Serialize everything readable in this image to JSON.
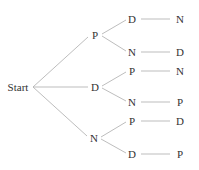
{
  "diagram": {
    "type": "tree",
    "title": "",
    "root": {
      "id": "start",
      "label": "Start",
      "x": 18,
      "y": 87
    },
    "nodes": [
      {
        "id": "l1_p",
        "label": "P",
        "x": 95,
        "y": 35
      },
      {
        "id": "l1_d",
        "label": "D",
        "x": 95,
        "y": 87
      },
      {
        "id": "l1_n",
        "label": "N",
        "x": 94,
        "y": 138
      },
      {
        "id": "l2_pd",
        "label": "D",
        "x": 132,
        "y": 19
      },
      {
        "id": "l2_pn",
        "label": "N",
        "x": 132,
        "y": 52
      },
      {
        "id": "l2_dp",
        "label": "P",
        "x": 132,
        "y": 71
      },
      {
        "id": "l2_dn",
        "label": "N",
        "x": 132,
        "y": 102
      },
      {
        "id": "l2_np",
        "label": "P",
        "x": 132,
        "y": 121
      },
      {
        "id": "l2_nd",
        "label": "D",
        "x": 132,
        "y": 154
      },
      {
        "id": "l3_pdn",
        "label": "N",
        "x": 180,
        "y": 19
      },
      {
        "id": "l3_pnd",
        "label": "D",
        "x": 180,
        "y": 52
      },
      {
        "id": "l3_dpn",
        "label": "N",
        "x": 180,
        "y": 71
      },
      {
        "id": "l3_dnp",
        "label": "P",
        "x": 180,
        "y": 102
      },
      {
        "id": "l3_npd",
        "label": "D",
        "x": 180,
        "y": 121
      },
      {
        "id": "l3_ndp",
        "label": "P",
        "x": 180,
        "y": 154
      }
    ],
    "edges": [
      {
        "from": "start",
        "to": "l1_p",
        "x1": 33,
        "y1": 87,
        "x2": 88,
        "y2": 37
      },
      {
        "from": "start",
        "to": "l1_d",
        "x1": 33,
        "y1": 87,
        "x2": 88,
        "y2": 87
      },
      {
        "from": "start",
        "to": "l1_n",
        "x1": 33,
        "y1": 87,
        "x2": 87,
        "y2": 136
      },
      {
        "from": "l1_p",
        "to": "l2_pd",
        "x1": 102,
        "y1": 34,
        "x2": 126,
        "y2": 20
      },
      {
        "from": "l1_p",
        "to": "l2_pn",
        "x1": 102,
        "y1": 36,
        "x2": 126,
        "y2": 51
      },
      {
        "from": "l1_d",
        "to": "l2_dp",
        "x1": 102,
        "y1": 86,
        "x2": 126,
        "y2": 72
      },
      {
        "from": "l1_d",
        "to": "l2_dn",
        "x1": 102,
        "y1": 88,
        "x2": 126,
        "y2": 101
      },
      {
        "from": "l1_n",
        "to": "l2_np",
        "x1": 101,
        "y1": 137,
        "x2": 126,
        "y2": 122
      },
      {
        "from": "l1_n",
        "to": "l2_nd",
        "x1": 101,
        "y1": 139,
        "x2": 126,
        "y2": 153
      },
      {
        "from": "l2_pd",
        "to": "l3_pdn",
        "x1": 141,
        "y1": 19,
        "x2": 170,
        "y2": 19
      },
      {
        "from": "l2_pn",
        "to": "l3_pnd",
        "x1": 141,
        "y1": 52,
        "x2": 170,
        "y2": 52
      },
      {
        "from": "l2_dp",
        "to": "l3_dpn",
        "x1": 141,
        "y1": 71,
        "x2": 170,
        "y2": 71
      },
      {
        "from": "l2_dn",
        "to": "l3_dnp",
        "x1": 141,
        "y1": 102,
        "x2": 170,
        "y2": 102
      },
      {
        "from": "l2_np",
        "to": "l3_npd",
        "x1": 141,
        "y1": 121,
        "x2": 170,
        "y2": 121
      },
      {
        "from": "l2_nd",
        "to": "l3_ndp",
        "x1": 141,
        "y1": 154,
        "x2": 170,
        "y2": 154
      }
    ]
  }
}
